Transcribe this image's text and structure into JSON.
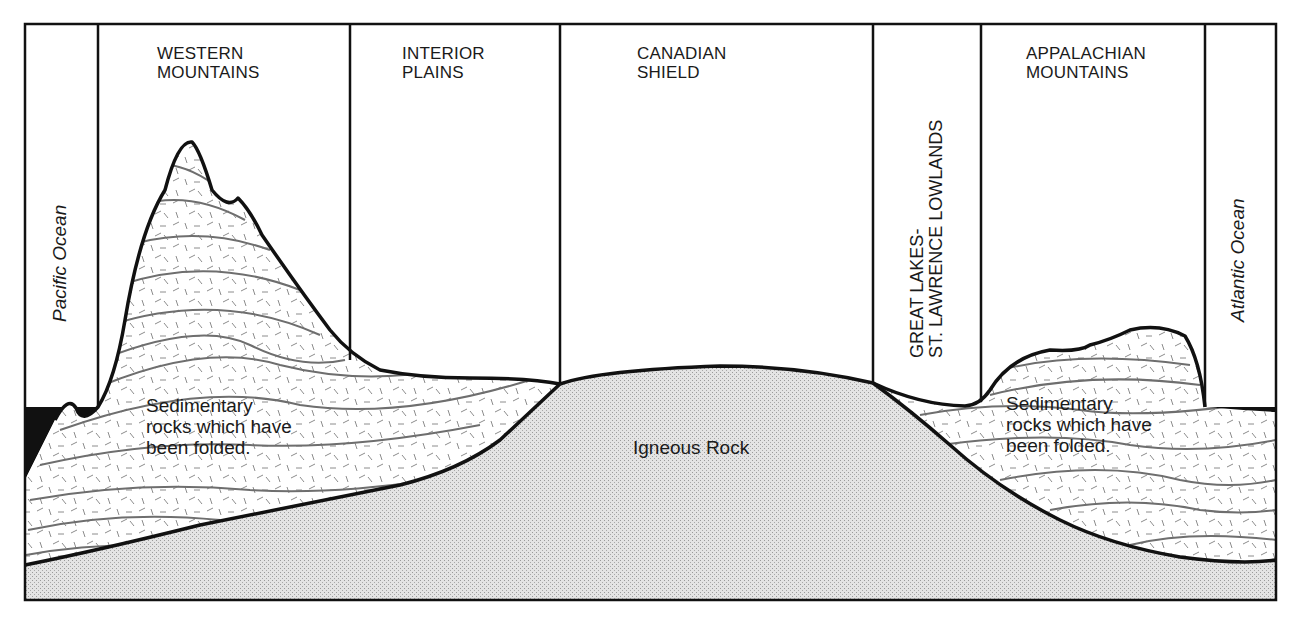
{
  "diagram": {
    "regions": [
      {
        "id": "pacific",
        "label": "Pacific Ocean",
        "orientation": "vertical"
      },
      {
        "id": "western",
        "line1": "WESTERN",
        "line2": "MOUNTAINS"
      },
      {
        "id": "interior",
        "line1": "INTERIOR",
        "line2": "PLAINS"
      },
      {
        "id": "shield",
        "line1": "CANADIAN",
        "line2": "SHIELD"
      },
      {
        "id": "lowlands",
        "line1": "GREAT LAKES-",
        "line2": "ST. LAWRENCE LOWLANDS",
        "orientation": "vertical"
      },
      {
        "id": "appalachian",
        "line1": "APPALACHIAN",
        "line2": "MOUNTAINS"
      },
      {
        "id": "atlantic",
        "label": "Atlantic Ocean",
        "orientation": "vertical"
      }
    ],
    "rock_labels": {
      "left_sedimentary": {
        "line1": "Sedimentary",
        "line2": "rocks which have",
        "line3": "been folded."
      },
      "igneous": "Igneous Rock",
      "right_sedimentary": {
        "line1": "Sedimentary",
        "line2": "rocks which have",
        "line3": "been folded."
      }
    },
    "colors": {
      "outline": "#111111",
      "ocean": "#111111",
      "igneous_fill": "#dcdcdc",
      "strata_line": "#6e6e6e",
      "background": "#ffffff"
    }
  }
}
